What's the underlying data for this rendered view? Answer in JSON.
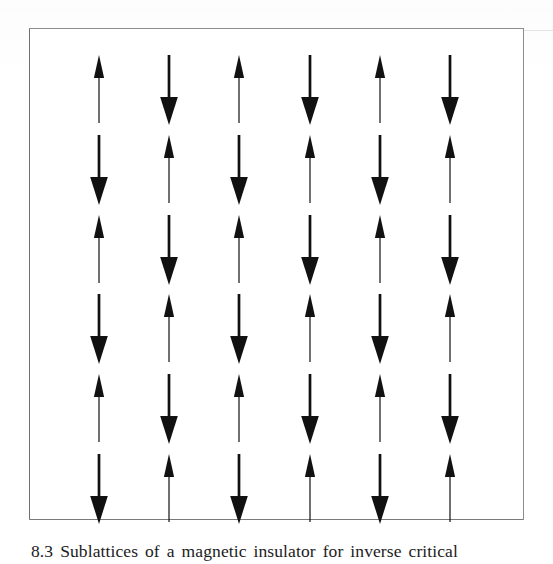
{
  "figure": {
    "frame": {
      "border_color": "#8d8d8d",
      "background": "#ffffff"
    },
    "caption": {
      "text": "8.3  Sublattices of a magnetic insulator for inverse critical",
      "note": "cropped at bottom edge of page, only letter tops visible"
    }
  },
  "chart_data": {
    "type": "heatmap",
    "xlabel": "",
    "ylabel": "",
    "grid": false,
    "legend": "none",
    "rows": 6,
    "columns": 6,
    "encoding": {
      "up": "spin-up arrow (thin shaft, narrow head)",
      "down": "spin-down arrow (thick shaft, wide head)"
    },
    "values": [
      [
        1,
        -1,
        1,
        -1,
        1,
        -1
      ],
      [
        -1,
        1,
        -1,
        1,
        -1,
        1
      ],
      [
        1,
        -1,
        1,
        -1,
        1,
        -1
      ],
      [
        -1,
        1,
        -1,
        1,
        -1,
        1
      ],
      [
        1,
        -1,
        1,
        -1,
        1,
        -1
      ],
      [
        -1,
        1,
        -1,
        1,
        -1,
        1
      ]
    ],
    "spins": [
      [
        "up",
        "down",
        "up",
        "down",
        "up",
        "down"
      ],
      [
        "down",
        "up",
        "down",
        "up",
        "down",
        "up"
      ],
      [
        "up",
        "down",
        "up",
        "down",
        "up",
        "down"
      ],
      [
        "down",
        "up",
        "down",
        "up",
        "down",
        "up"
      ],
      [
        "up",
        "down",
        "up",
        "down",
        "up",
        "down"
      ],
      [
        "down",
        "up",
        "down",
        "up",
        "down",
        "up"
      ]
    ],
    "column_centers_px": [
      70,
      140,
      210,
      281,
      351,
      421
    ],
    "row_centers_px": [
      62,
      142,
      222,
      301,
      381,
      461
    ],
    "arrow_color": "#111111"
  }
}
